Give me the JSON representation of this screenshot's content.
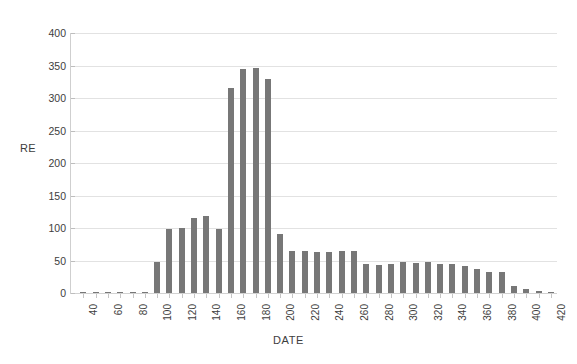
{
  "chart_data": {
    "type": "bar",
    "title": "",
    "xlabel": "DATE",
    "ylabel": "RE",
    "xlim": [
      30,
      425
    ],
    "ylim": [
      0,
      400
    ],
    "grid": true,
    "legend": false,
    "bar_color": "#777777",
    "gridline_color": "#e2e2e2",
    "y_ticks": [
      0,
      50,
      100,
      150,
      200,
      250,
      300,
      350,
      400
    ],
    "y_tick_labels": [
      "0",
      "50",
      "100",
      "150",
      "200",
      "250",
      "300",
      "350",
      "400"
    ],
    "x_tick_labels": [
      "40",
      "60",
      "80",
      "100",
      "120",
      "140",
      "160",
      "180",
      "200",
      "220",
      "240",
      "260",
      "280",
      "300",
      "320",
      "340",
      "360",
      "380",
      "400",
      "420"
    ],
    "x_tick_values": [
      40,
      60,
      80,
      100,
      120,
      140,
      160,
      180,
      200,
      220,
      240,
      260,
      280,
      300,
      320,
      340,
      360,
      380,
      400,
      420
    ],
    "x": [
      40,
      50,
      60,
      70,
      80,
      90,
      100,
      110,
      120,
      130,
      140,
      150,
      160,
      170,
      180,
      190,
      200,
      210,
      220,
      230,
      240,
      250,
      260,
      270,
      280,
      290,
      300,
      310,
      320,
      330,
      340,
      350,
      360,
      370,
      380,
      390,
      400,
      410,
      420
    ],
    "values": [
      2,
      2,
      2,
      2,
      2,
      2,
      47,
      99,
      100,
      115,
      119,
      99,
      315,
      345,
      346,
      329,
      91,
      64,
      65,
      63,
      63,
      65,
      65,
      44,
      43,
      44,
      47,
      46,
      47,
      45,
      45,
      41,
      37,
      33,
      33,
      11,
      6,
      3,
      2
    ],
    "categories": [
      "40",
      "50",
      "60",
      "70",
      "80",
      "90",
      "100",
      "110",
      "120",
      "130",
      "140",
      "150",
      "160",
      "170",
      "180",
      "190",
      "200",
      "210",
      "220",
      "230",
      "240",
      "250",
      "260",
      "270",
      "280",
      "290",
      "300",
      "310",
      "320",
      "330",
      "340",
      "350",
      "360",
      "370",
      "380",
      "390",
      "400",
      "410",
      "420"
    ]
  },
  "axes": {
    "y_title": "RE",
    "x_title": "DATE"
  }
}
